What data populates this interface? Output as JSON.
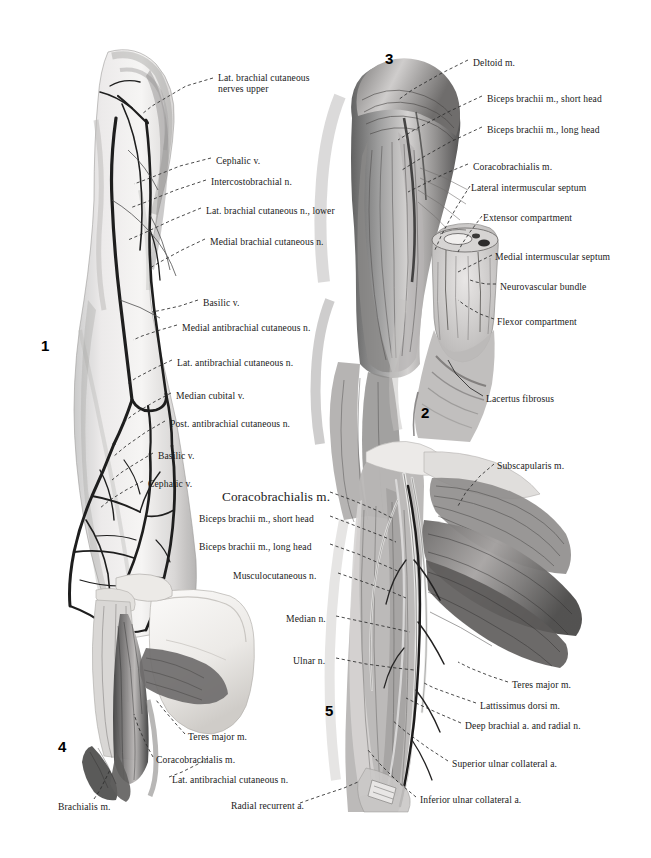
{
  "plate": {
    "title": "Anatomical plate: arm musculature, nerves and vessels",
    "background": "#ffffff",
    "ink": "#1a1a1a"
  },
  "figures": [
    {
      "number": "1",
      "x": 41,
      "y": 337,
      "caption": "Superficial veins and cutaneous nerves of arm and forearm"
    },
    {
      "number": "2",
      "x": 421,
      "y": 404,
      "caption": "Cross-section of arm compartments"
    },
    {
      "number": "3",
      "x": 385,
      "y": 50,
      "caption": "Anterior arm musculature"
    },
    {
      "number": "4",
      "x": 58,
      "y": 738,
      "caption": "Scapula with coracobrachialis and teres major"
    },
    {
      "number": "5",
      "x": 325,
      "y": 702,
      "caption": "Deep dissection of axilla and medial arm"
    }
  ],
  "labels": [
    {
      "id": "lat-brachial-cut-nerves-upper",
      "figure": "1",
      "text": "Lat. brachial cutaneous\nnerves upper",
      "x": 218,
      "y": 72,
      "align": "left",
      "size": "small"
    },
    {
      "id": "cephalic-v-upper",
      "figure": "1",
      "text": "Cephalic v.",
      "x": 216,
      "y": 155,
      "align": "left",
      "size": "small"
    },
    {
      "id": "intercostobrachial-n",
      "figure": "1",
      "text": "Intercostobrachial n.",
      "x": 211,
      "y": 176,
      "align": "left",
      "size": "small"
    },
    {
      "id": "lat-brachial-cut-n-lower",
      "figure": "1",
      "text": "Lat. brachial cutaneous n., lower",
      "x": 206,
      "y": 205,
      "align": "left",
      "size": "small"
    },
    {
      "id": "medial-brachial-cut-n",
      "figure": "1",
      "text": "Medial brachial cutaneous n.",
      "x": 210,
      "y": 236,
      "align": "left",
      "size": "small"
    },
    {
      "id": "basilic-v-upper",
      "figure": "1",
      "text": "Basilic v.",
      "x": 203,
      "y": 297,
      "align": "left",
      "size": "small"
    },
    {
      "id": "medial-antibrachial-cut-n",
      "figure": "1",
      "text": "Medial antibrachial cutaneous n.",
      "x": 182,
      "y": 322,
      "align": "left",
      "size": "small"
    },
    {
      "id": "lat-antibrachial-cut-n-fig1",
      "figure": "1",
      "text": "Lat. antibrachial cutaneous n.",
      "x": 177,
      "y": 357,
      "align": "left",
      "size": "small"
    },
    {
      "id": "median-cubital-v",
      "figure": "1",
      "text": "Median cubital v.",
      "x": 176,
      "y": 390,
      "align": "left",
      "size": "small"
    },
    {
      "id": "post-antibrachial-cut-n",
      "figure": "1",
      "text": "Post. antibrachial cutaneous n.",
      "x": 170,
      "y": 418,
      "align": "left",
      "size": "small"
    },
    {
      "id": "basilic-v-lower",
      "figure": "1",
      "text": "Basilic v.",
      "x": 158,
      "y": 450,
      "align": "left",
      "size": "small"
    },
    {
      "id": "cephalic-v-lower",
      "figure": "1",
      "text": "Cephalic v.",
      "x": 148,
      "y": 478,
      "align": "left",
      "size": "small"
    },
    {
      "id": "deltoid-m",
      "figure": "3",
      "text": "Deltoid m.",
      "x": 473,
      "y": 57,
      "align": "left",
      "size": "small"
    },
    {
      "id": "biceps-short-head-fig3",
      "figure": "3",
      "text": "Biceps brachii m., short head",
      "x": 487,
      "y": 93,
      "align": "left",
      "size": "small"
    },
    {
      "id": "biceps-long-head-fig3",
      "figure": "3",
      "text": "Biceps brachii m., long head",
      "x": 487,
      "y": 124,
      "align": "left",
      "size": "small"
    },
    {
      "id": "coracobrachialis-m-fig3",
      "figure": "3",
      "text": "Coracobrachialis m.",
      "x": 473,
      "y": 161,
      "align": "left",
      "size": "small"
    },
    {
      "id": "lateral-intermuscular-septum",
      "figure": "3",
      "text": "Lateral intermuscular septum",
      "x": 471,
      "y": 182,
      "align": "left",
      "size": "small"
    },
    {
      "id": "extensor-compartment",
      "figure": "2",
      "text": "Extensor compartment",
      "x": 483,
      "y": 212,
      "align": "left",
      "size": "small"
    },
    {
      "id": "medial-intermuscular-septum",
      "figure": "2",
      "text": "Medial intermuscular septum",
      "x": 495,
      "y": 251,
      "align": "left",
      "size": "small"
    },
    {
      "id": "neurovascular-bundle",
      "figure": "2",
      "text": "Neurovascular bundle",
      "x": 500,
      "y": 281,
      "align": "left",
      "size": "small"
    },
    {
      "id": "flexor-compartment",
      "figure": "2",
      "text": "Flexor compartment",
      "x": 497,
      "y": 316,
      "align": "left",
      "size": "small"
    },
    {
      "id": "lacertus-fibrosus",
      "figure": "2",
      "text": "Lacertus fibrosus",
      "x": 486,
      "y": 393,
      "align": "left",
      "size": "small"
    },
    {
      "id": "coracobrachialis-m-fig5",
      "figure": "5",
      "text": "Coracobrachialis m.",
      "x": 222,
      "y": 489,
      "align": "left",
      "size": "big"
    },
    {
      "id": "biceps-short-head-fig5",
      "figure": "5",
      "text": "Biceps brachii m., short head",
      "x": 199,
      "y": 513,
      "align": "left",
      "size": "small"
    },
    {
      "id": "biceps-long-head-fig5",
      "figure": "5",
      "text": "Biceps brachii m., long head",
      "x": 199,
      "y": 541,
      "align": "left",
      "size": "small"
    },
    {
      "id": "musculocutaneous-n",
      "figure": "5",
      "text": "Musculocutaneous n.",
      "x": 233,
      "y": 570,
      "align": "left",
      "size": "small"
    },
    {
      "id": "median-n",
      "figure": "5",
      "text": "Median n.",
      "x": 286,
      "y": 613,
      "align": "left",
      "size": "small"
    },
    {
      "id": "ulnar-n",
      "figure": "5",
      "text": "Ulnar n.",
      "x": 293,
      "y": 655,
      "align": "left",
      "size": "small"
    },
    {
      "id": "subscapularis-m",
      "figure": "5",
      "text": "Subscapularis m.",
      "x": 497,
      "y": 460,
      "align": "left",
      "size": "small"
    },
    {
      "id": "teres-major-m-fig5",
      "figure": "5",
      "text": "Teres major m.",
      "x": 512,
      "y": 679,
      "align": "left",
      "size": "small"
    },
    {
      "id": "lattissimus-dorsi-m",
      "figure": "5",
      "text": "Lattissimus dorsi m.",
      "x": 480,
      "y": 700,
      "align": "left",
      "size": "small"
    },
    {
      "id": "deep-brachial-a-and-radial-n",
      "figure": "5",
      "text": "Deep brachial a. and radial n.",
      "x": 465,
      "y": 720,
      "align": "left",
      "size": "small"
    },
    {
      "id": "superior-ulnar-collateral-a",
      "figure": "5",
      "text": "Superior ulnar collateral a.",
      "x": 452,
      "y": 758,
      "align": "left",
      "size": "small"
    },
    {
      "id": "inferior-ulnar-collateral-a",
      "figure": "5",
      "text": "Inferior ulnar collateral a.",
      "x": 420,
      "y": 794,
      "align": "left",
      "size": "small"
    },
    {
      "id": "radial-recurrent-a",
      "figure": "5",
      "text": "Radial recurrent a.",
      "x": 231,
      "y": 800,
      "align": "left",
      "size": "small"
    },
    {
      "id": "teres-major-m-fig4",
      "figure": "4",
      "text": "Teres major m.",
      "x": 188,
      "y": 731,
      "align": "left",
      "size": "small"
    },
    {
      "id": "coracobrachialis-m-fig4",
      "figure": "4",
      "text": "Coracobrachialis m.",
      "x": 156,
      "y": 754,
      "align": "left",
      "size": "small"
    },
    {
      "id": "lat-antibrachial-cut-n-fig4",
      "figure": "4",
      "text": "Lat. antibrachial cutaneous n.",
      "x": 172,
      "y": 774,
      "align": "left",
      "size": "small"
    },
    {
      "id": "brachialis-m",
      "figure": "4",
      "text": "Brachialis m.",
      "x": 58,
      "y": 801,
      "align": "left",
      "size": "small"
    }
  ]
}
